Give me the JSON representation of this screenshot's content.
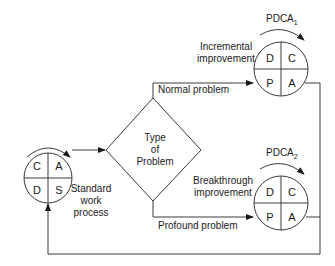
{
  "diagram": {
    "standard_cycle": {
      "quadrants": {
        "top_left": "C",
        "top_right": "A",
        "bottom_left": "D",
        "bottom_right": "S"
      },
      "label_lines": [
        "Standard",
        "work",
        "process"
      ]
    },
    "decision": {
      "label_lines": [
        "Type",
        "of",
        "Problem"
      ]
    },
    "normal_path_label": "Normal problem",
    "profound_path_label": "Profound problem",
    "pdca1": {
      "title": "PDCA",
      "subscript": "1",
      "quadrants": {
        "top_left": "D",
        "top_right": "C",
        "bottom_left": "P",
        "bottom_right": "A"
      },
      "label_lines": [
        "Incremental",
        "improvement"
      ]
    },
    "pdca2": {
      "title": "PDCA",
      "subscript": "2",
      "quadrants": {
        "top_left": "D",
        "top_right": "C",
        "bottom_left": "P",
        "bottom_right": "A"
      },
      "label_lines": [
        "Breakthrough",
        "improvement"
      ]
    },
    "colors": {
      "line": "#3a3a3a",
      "text": "#1a1a1a",
      "background": "#ffffff"
    }
  }
}
